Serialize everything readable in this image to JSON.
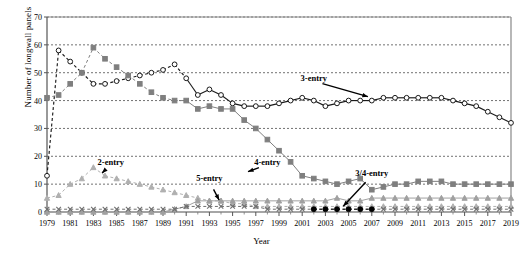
{
  "chart_data": {
    "type": "line",
    "title": "",
    "xlabel": "Year",
    "ylabel": "Number of longwall panels",
    "xlim": [
      1979,
      2019
    ],
    "ylim": [
      0,
      70
    ],
    "ytick_step": 10,
    "xtick_step": 2,
    "yticks": [
      0,
      10,
      20,
      30,
      40,
      50,
      60,
      70
    ],
    "xticks": [
      1979,
      1981,
      1983,
      1985,
      1987,
      1989,
      1991,
      1993,
      1995,
      1997,
      1999,
      2001,
      2003,
      2005,
      2007,
      2009,
      2011,
      2013,
      2015,
      2017,
      2019
    ],
    "grid": true,
    "grid_style": "dotted-horizontal",
    "legend": "inline-annotations",
    "x": [
      1979,
      1980,
      1981,
      1982,
      1983,
      1984,
      1985,
      1986,
      1987,
      1988,
      1989,
      1990,
      1991,
      1992,
      1993,
      1994,
      1995,
      1996,
      1997,
      1998,
      1999,
      2000,
      2001,
      2002,
      2003,
      2004,
      2005,
      2006,
      2007,
      2008,
      2009,
      2010,
      2011,
      2012,
      2013,
      2014,
      2015,
      2016,
      2017,
      2018,
      2019
    ],
    "series": [
      {
        "name": "3-entry",
        "label": "3-entry",
        "color": "#1a1a1a",
        "marker": "open-circle",
        "line": "solid-and-dashed",
        "values": [
          13,
          58,
          54,
          50,
          46,
          46,
          47,
          48,
          49,
          50,
          51,
          53,
          48,
          42,
          44,
          42,
          39,
          38,
          38,
          38,
          39,
          40,
          41,
          40,
          38,
          39,
          40,
          40,
          40,
          41,
          41,
          41,
          41,
          41,
          41,
          40,
          39,
          38,
          36,
          34,
          32
        ]
      },
      {
        "name": "4-entry",
        "label": "4-entry",
        "color": "#7f7f7f",
        "marker": "filled-square",
        "line": "solid-and-dashed",
        "values": [
          41,
          42,
          46,
          50,
          59,
          55,
          52,
          49,
          46,
          43,
          41,
          40,
          40,
          37,
          38,
          37,
          37,
          33,
          30,
          26,
          22,
          18,
          13,
          12,
          11,
          10,
          11,
          12,
          8,
          9,
          10,
          10,
          11,
          11,
          11,
          10,
          10,
          10,
          10,
          10,
          10
        ]
      },
      {
        "name": "2-entry",
        "label": "2-entry",
        "color": "#b0b0b0",
        "marker": "filled-triangle",
        "line": "dashed",
        "values": [
          5,
          6,
          10,
          12,
          16,
          13,
          12,
          11,
          10,
          9,
          8,
          7,
          6,
          5,
          4,
          4,
          3,
          3,
          2,
          2,
          2,
          2,
          2,
          2,
          2,
          2,
          2,
          2,
          2,
          2,
          2,
          2,
          2,
          2,
          2,
          2,
          2,
          2,
          2,
          2,
          2
        ]
      },
      {
        "name": "5-entry",
        "label": "5-entry",
        "color": "#a0a0a0",
        "marker": "filled-triangle",
        "line": "solid",
        "values": [
          0,
          0,
          0,
          0,
          0,
          0,
          0,
          0,
          0,
          0,
          0,
          1,
          2,
          4,
          4,
          4,
          4,
          4,
          4,
          4,
          4,
          4,
          4,
          4,
          4,
          5,
          4,
          4,
          5,
          5,
          5,
          5,
          5,
          5,
          5,
          5,
          5,
          5,
          5,
          5,
          5
        ]
      },
      {
        "name": "other-entry",
        "label": "",
        "color": "#6e6e6e",
        "marker": "x",
        "line": "dashed",
        "values": [
          1,
          1,
          1,
          1,
          1,
          1,
          1,
          1,
          1,
          1,
          1,
          1,
          2,
          2,
          2,
          2,
          2,
          2,
          2,
          1,
          1,
          1,
          1,
          1,
          1,
          1,
          1,
          1,
          1,
          1,
          1,
          1,
          1,
          1,
          1,
          1,
          1,
          1,
          1,
          1,
          1
        ]
      },
      {
        "name": "3/4-entry",
        "label": "3/4-entry",
        "color": "#000000",
        "marker": "filled-circle",
        "line": "dashed",
        "values": [
          null,
          null,
          null,
          null,
          null,
          null,
          null,
          null,
          null,
          null,
          null,
          null,
          null,
          null,
          null,
          null,
          null,
          null,
          null,
          null,
          null,
          null,
          null,
          1,
          1,
          1,
          1,
          1,
          1,
          null,
          null,
          null,
          null,
          null,
          null,
          null,
          null,
          null,
          null,
          null,
          null
        ]
      }
    ],
    "annotations": [
      {
        "text": "3-entry",
        "x": 2002,
        "y": 47,
        "anchor_x": 2007,
        "anchor_y": 41,
        "bold": true
      },
      {
        "text": "4-entry",
        "x": 1998,
        "y": 17,
        "anchor_x": 1996,
        "anchor_y": 14,
        "bold": true
      },
      {
        "text": "2-entry",
        "x": 1984.5,
        "y": 17,
        "anchor_x": 1983.5,
        "anchor_y": 13,
        "bold": true
      },
      {
        "text": "5-entry",
        "x": 1993,
        "y": 11,
        "anchor_x": 1994,
        "anchor_y": 3,
        "bold": true
      },
      {
        "text": "3/4-entry",
        "x": 2007,
        "y": 13,
        "anchor_x": 2004.3,
        "anchor_y": 1,
        "bold": true
      }
    ]
  }
}
